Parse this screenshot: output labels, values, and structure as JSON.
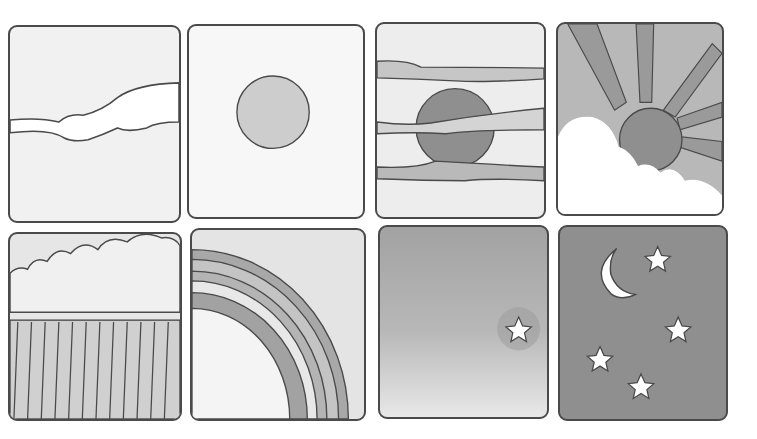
{
  "illustration": {
    "style": "grayscale watercolor with hand-drawn outlines",
    "colors": {
      "background": "#ffffff",
      "outline": "#4a4a4a",
      "light_wash": "#ebebeb",
      "mid_wash": "#c4c4c4",
      "dark_wash": "#9a9a9a",
      "night_sky": "#8f8f8f"
    },
    "panels": [
      {
        "id": 1,
        "label": "Cloudy sky with streak of cloud"
      },
      {
        "id": 2,
        "label": "Sun"
      },
      {
        "id": 3,
        "label": "Sunset behind cloud bands"
      },
      {
        "id": 4,
        "label": "Sun rays behind cloud"
      },
      {
        "id": 5,
        "label": "Rain cloud with rain"
      },
      {
        "id": 6,
        "label": "Rainbow"
      },
      {
        "id": 7,
        "label": "Dusk sky with one star"
      },
      {
        "id": 8,
        "label": "Night sky with moon and stars"
      }
    ]
  }
}
